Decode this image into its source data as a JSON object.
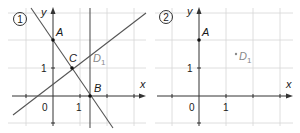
{
  "panels": [
    {
      "id": "panel-1",
      "badge": "1",
      "axes": {
        "x_label": "x",
        "y_label": "y",
        "origin_label": "0",
        "x_tick_label": "1",
        "y_tick_label": "1"
      },
      "points": {
        "A": {
          "label": "A",
          "coords": [
            0,
            2
          ]
        },
        "B": {
          "label": "B",
          "coords": [
            1.35,
            0
          ]
        },
        "C": {
          "label": "C",
          "coords": [
            0.7,
            1
          ]
        },
        "D1": {
          "label": "D",
          "sub": "1",
          "coords": [
            1.35,
            1.55
          ]
        }
      },
      "lines": [
        "line AB",
        "line through C and D1",
        "vertical line x = 1.35"
      ]
    },
    {
      "id": "panel-2",
      "badge": "2",
      "axes": {
        "x_label": "x",
        "y_label": "y",
        "origin_label": "0",
        "x_tick_label": "1",
        "y_tick_label": "1"
      },
      "points": {
        "A": {
          "label": "A",
          "coords": [
            0,
            2
          ]
        },
        "D1": {
          "label": "D",
          "sub": "1",
          "coords": [
            1.35,
            1.5
          ]
        }
      }
    }
  ],
  "colors": {
    "grid": "#d4d4d4",
    "axis": "#333333",
    "line": "#555555",
    "accent_gray": "#8a8a8a"
  }
}
